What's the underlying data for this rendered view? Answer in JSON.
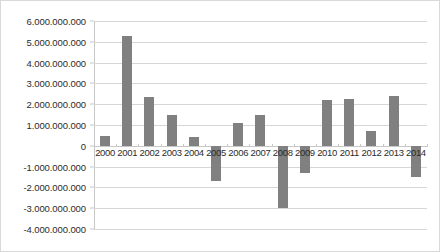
{
  "chart_data": {
    "type": "bar",
    "title": "",
    "xlabel": "",
    "ylabel": "",
    "categories": [
      "2000",
      "2001",
      "2002",
      "2003",
      "2004",
      "2005",
      "2006",
      "2007",
      "2008",
      "2009",
      "2010",
      "2011",
      "2012",
      "2013",
      "2014"
    ],
    "values": [
      450000000,
      5300000000,
      2350000000,
      1500000000,
      400000000,
      -1700000000,
      1100000000,
      1500000000,
      -3000000000,
      -1300000000,
      2200000000,
      2250000000,
      700000000,
      2400000000,
      -1500000000
    ],
    "ylim": [
      -4000000000,
      6000000000
    ],
    "ytick_values": [
      6000000000,
      5000000000,
      4000000000,
      3000000000,
      2000000000,
      1000000000,
      0,
      -1000000000,
      -2000000000,
      -3000000000,
      -4000000000
    ],
    "ytick_labels": [
      "6.000.000.000",
      "5.000.000.000",
      "4.000.000.000",
      "3.000.000.000",
      "2.000.000.000",
      "1.000.000.000",
      "0",
      "-1.000.000.000",
      "-2.000.000.000",
      "-3.000.000.000",
      "-4.000.000.000"
    ],
    "grid": true,
    "legend": false,
    "legend_position": "none",
    "bar_color": "#808080",
    "gridline_color": "#d6d6d6",
    "axis_color": "#c8c8c8",
    "background_color": "#ffffff",
    "border_color": "#d9d9d9"
  }
}
